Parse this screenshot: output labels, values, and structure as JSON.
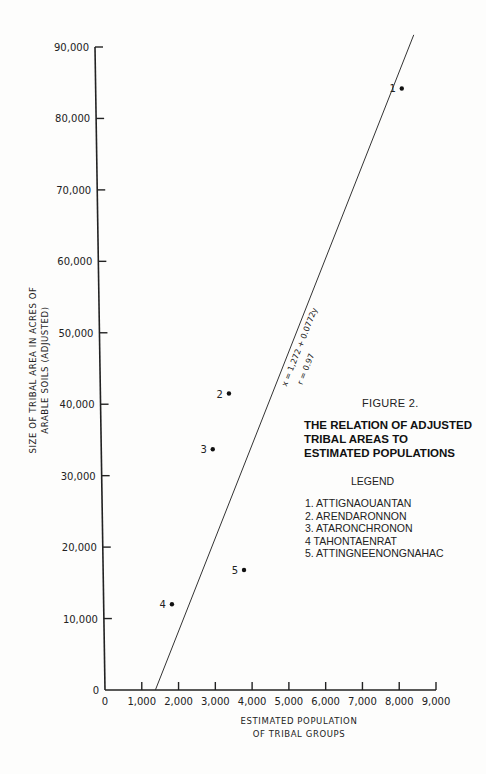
{
  "chart_data": {
    "type": "scatter",
    "title": "THE RELATION OF ADJUSTED TRIBAL AREAS TO ESTIMATED POPULATIONS",
    "figure_label": "FIGURE 2.",
    "title_lines": [
      "THE RELATION OF ADJUSTED",
      "TRIBAL AREAS TO",
      "ESTIMATED POPULATIONS"
    ],
    "xlabel_lines": [
      "ESTIMATED POPULATION",
      "OF TRIBAL GROUPS"
    ],
    "ylabel_lines": [
      "SIZE OF TRIBAL AREA IN ACRES OF",
      "ARABLE SOILS (ADJUSTED)"
    ],
    "xlabel": "ESTIMATED POPULATION OF TRIBAL GROUPS",
    "ylabel": "SIZE OF TRIBAL AREA IN ACRES OF ARABLE SOILS (ADJUSTED)",
    "xlim": [
      0,
      9000
    ],
    "ylim": [
      0,
      90000
    ],
    "x_ticks": [
      "0",
      "1,000",
      "2,000",
      "3,000",
      "4,000",
      "5,000",
      "6,000",
      "7,000",
      "8,000",
      "9,000"
    ],
    "y_ticks": [
      "0",
      "10,000",
      "20,000",
      "30,000",
      "40,000",
      "50,000",
      "60,000",
      "70,000",
      "80,000",
      "90,000"
    ],
    "points": [
      {
        "label": "1",
        "name": "ATTIGNAOUANTAN",
        "x": 8070,
        "y": 84200
      },
      {
        "label": "2",
        "name": "ARENDARONNON",
        "x": 3370,
        "y": 41500
      },
      {
        "label": "3",
        "name": "ATARONCHRONON",
        "x": 2930,
        "y": 33700
      },
      {
        "label": "4",
        "name": "TAHONTAENRAT",
        "x": 1820,
        "y": 12000
      },
      {
        "label": "5",
        "name": "ATTINGNEENONGNAHAC",
        "x": 3780,
        "y": 16800
      }
    ],
    "regression": {
      "equation": "x = 1,272 + 0.0772y",
      "r": "r = 0.97",
      "intercept_x": 1272,
      "slope": 0.0772
    },
    "legend": {
      "title": "LEGEND",
      "position": "right",
      "entries": [
        "1. ATTIGNAOUANTAN",
        "2. ARENDARONNON",
        "3. ATARONCHRONON",
        "4  TAHONTAENRAT",
        "5. ATTINGNEENONGNAHAC"
      ]
    },
    "grid": false
  }
}
